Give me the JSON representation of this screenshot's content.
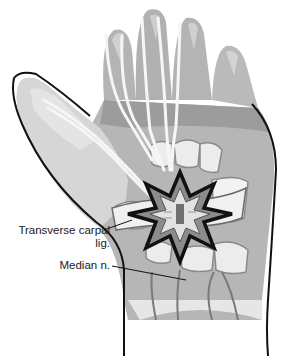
{
  "figure": {
    "labels": [
      {
        "id": "transverse-carpal-lig",
        "line1": "Transverse carpal",
        "line2": "lig."
      },
      {
        "id": "median-n",
        "line1": "Median n."
      }
    ],
    "colors": {
      "outline": "#111111",
      "skin_dark": "#9a9a9a",
      "skin_mid": "#b8b8b8",
      "skin_light": "#d4d4d4",
      "bone": "#ececec",
      "tendon": "#f4f4f4",
      "burst_fill": "#8a8a8a",
      "burst_core": "#e8e8e8"
    }
  }
}
